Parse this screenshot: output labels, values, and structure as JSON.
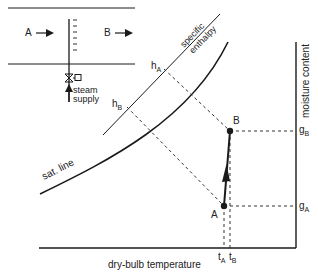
{
  "inset": {
    "inlet_label": "A",
    "outlet_label": "B",
    "supply_label_1": "steam",
    "supply_label_2": "supply"
  },
  "chart": {
    "xlabel": "dry-bulb temperature",
    "ylabel": "moisture content",
    "sat_line_label": "sat. line",
    "enthalpy_label_1": "specific",
    "enthalpy_label_2": "enthalpy",
    "point_a": "A",
    "point_b": "B",
    "h_a": "h",
    "h_a_sub": "A",
    "h_b": "h",
    "h_b_sub": "B",
    "g_a": "g",
    "g_a_sub": "A",
    "g_b": "g",
    "g_b_sub": "B",
    "t_a": "t",
    "t_a_sub": "A",
    "t_b": "t",
    "t_b_sub": "B"
  },
  "colors": {
    "ink": "#1a1a1a",
    "background": "#ffffff"
  }
}
